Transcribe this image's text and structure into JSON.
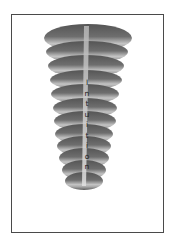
{
  "figure": {
    "label": "Intuition",
    "letters": [
      "I",
      "n",
      "t",
      "u",
      "i",
      "t",
      "i",
      "o",
      "n"
    ],
    "colors": {
      "frame": "#4a4a4a",
      "dark": "#5a5a5a",
      "light": "#d8d8d8",
      "beam": "#c8c8c8"
    }
  }
}
